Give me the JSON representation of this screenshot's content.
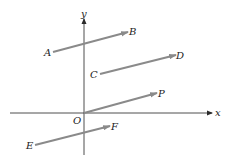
{
  "diagram": {
    "axes": {
      "x_label": "x",
      "y_label": "y",
      "origin_label": "O",
      "color": "#3a3a3a"
    },
    "vector_color": "#8a8a8a",
    "vectors": [
      {
        "from": "A",
        "to": "B"
      },
      {
        "from": "C",
        "to": "D"
      },
      {
        "from": "O",
        "to": "P"
      },
      {
        "from": "E",
        "to": "F"
      }
    ],
    "labels": {
      "A": "A",
      "B": "B",
      "C": "C",
      "D": "D",
      "P": "P",
      "E": "E",
      "F": "F"
    }
  }
}
